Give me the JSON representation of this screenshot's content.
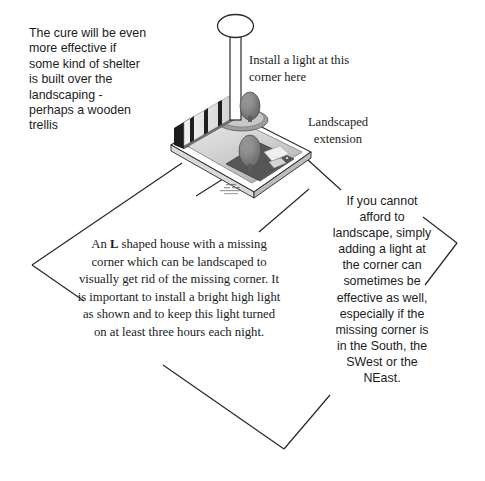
{
  "diagram": {
    "background_color": "#ffffff",
    "line_color": "#1a1a1a"
  },
  "callouts": {
    "cure_note": "The cure will be even more effective if some kind of shelter is built over the landscaping - perhaps a wooden trellis",
    "install_light_note": "Install a light at this corner here",
    "landscaped_extension_label": "Landscaped extension",
    "house_note_before_bold": "An ",
    "house_note_bold": "L",
    "house_note_after_bold": " shaped house  with a missing corner which can be landscaped to visually get rid of the missing corner. It is important to install a bright high light as shown and to keep this light turned on at least three hours each night.",
    "afford_note": "If you cannot afford to landscape, simply adding a light at the corner can sometimes be effective as well, especially if the missing corner is in the South, the SWest or the NEast."
  },
  "illustration": {
    "name": "isometric-house-landscaping",
    "elements": [
      "lamp-post",
      "lamp-head",
      "fence-panel",
      "house-wall",
      "ground-platform",
      "shrub-upper",
      "shrub-lower",
      "paving-stones",
      "gravel-bed"
    ],
    "colors": {
      "platform_light": "#e3e3e3",
      "platform_mid": "#bfbfbf",
      "platform_dark": "#8f8f8f",
      "wall_dark": "#1e1e1e",
      "shrub": "#7a7a7a",
      "edge": "#2b2b2b"
    }
  }
}
